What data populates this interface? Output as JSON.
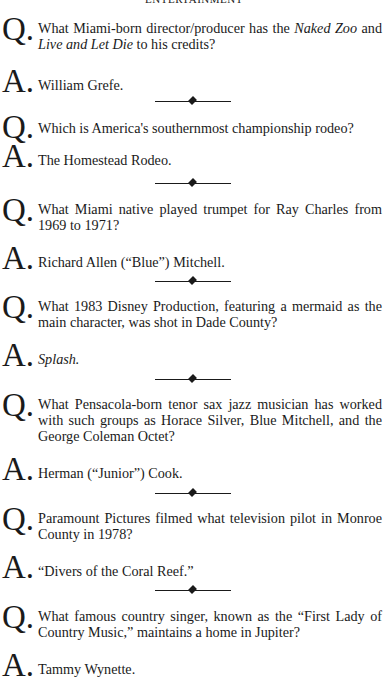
{
  "page": {
    "running_head": "ENTERTAINMENT",
    "question_marker": "Q.",
    "answer_marker": "A.",
    "divider_icon": "diamond-rule"
  },
  "items": [
    {
      "question_parts": [
        "What Miami-born director/producer has the ",
        "Naked Zoo",
        " and ",
        "Live and Let Die",
        " to his credits?"
      ],
      "question": "What Miami-born director/producer has the Naked Zoo and Live and Let Die to his credits?",
      "answer": "William Grefe."
    },
    {
      "question": "Which is America's southernmost championship rodeo?",
      "answer": "The Homestead Rodeo."
    },
    {
      "question": "What Miami native played trumpet for Ray Charles from 1969 to 1971?",
      "answer": "Richard Allen (“Blue”) Mitchell."
    },
    {
      "question": "What 1983 Disney Production, featuring a mermaid as the main character, was shot in Dade County?",
      "answer": "Splash."
    },
    {
      "question": "What Pensacola-born tenor sax jazz musician has worked with such groups as Horace Silver, Blue Mitchell, and the George Coleman Octet?",
      "answer": "Herman (“Junior”) Cook."
    },
    {
      "question": "Paramount Pictures filmed what television pilot in Monroe County in 1978?",
      "answer": "“Divers of the Coral Reef.”"
    },
    {
      "question": "What famous country singer, known as the “First Lady of Country Music,” maintains a home in Jupiter?",
      "answer": "Tammy Wynette."
    }
  ]
}
